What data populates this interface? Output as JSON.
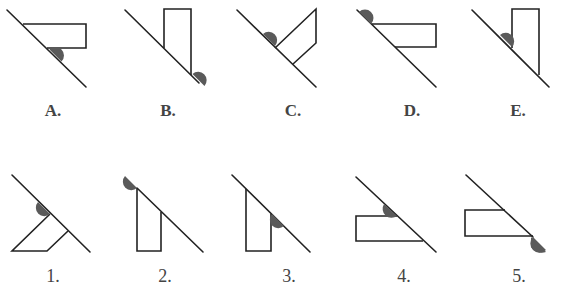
{
  "figure": {
    "title": "",
    "colors": {
      "stroke": "#222222",
      "semicircle": "#5a5a5a",
      "background": "#ffffff"
    },
    "top_row": [
      {
        "label": "A.",
        "x": 53
      },
      {
        "label": "B.",
        "x": 168
      },
      {
        "label": "C.",
        "x": 293
      },
      {
        "label": "D.",
        "x": 412
      },
      {
        "label": "E.",
        "x": 518
      }
    ],
    "bottom_row": [
      {
        "label": "1.",
        "x": 53
      },
      {
        "label": "2.",
        "x": 165
      },
      {
        "label": "3.",
        "x": 289
      },
      {
        "label": "4.",
        "x": 404
      },
      {
        "label": "5.",
        "x": 519
      }
    ]
  }
}
